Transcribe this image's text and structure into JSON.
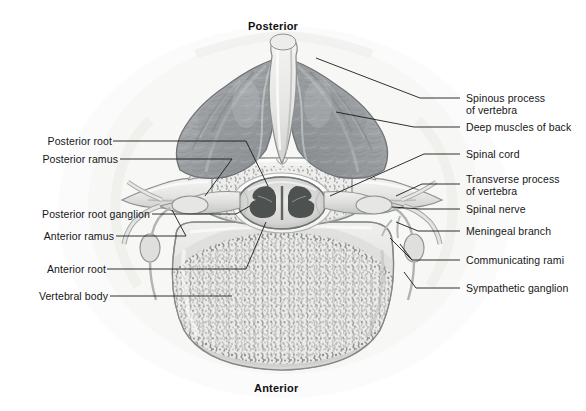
{
  "figure": {
    "title_top": "Posterior",
    "title_bottom": "Anterior",
    "background_color": "#ffffff",
    "line_color": "#1a1a1a",
    "text_color": "#161616"
  },
  "orientation_labels": [
    {
      "name": "posterior",
      "text": "Posterior",
      "x": 280,
      "y": 20
    },
    {
      "name": "anterior",
      "text": "Anterior",
      "x": 280,
      "y": 382
    }
  ],
  "left_labels": [
    {
      "id": "posterior-root",
      "text": "Posterior root",
      "x": 28,
      "y": 138
    },
    {
      "id": "posterior-ramus",
      "text": "Posterior ramus",
      "x": 28,
      "y": 156
    },
    {
      "id": "posterior-root-ganglion",
      "text": "Posterior root ganglion",
      "x": 28,
      "y": 211
    },
    {
      "id": "anterior-ramus",
      "text": "Anterior ramus",
      "x": 28,
      "y": 233
    },
    {
      "id": "anterior-root",
      "text": "Anterior root",
      "x": 28,
      "y": 266
    },
    {
      "id": "vertebral-body",
      "text": "Vertebral body",
      "x": 28,
      "y": 293
    }
  ],
  "right_labels": [
    {
      "id": "spinous-process",
      "line1": "Spinous process",
      "line2": "of vertebra",
      "x": 466,
      "y": 94
    },
    {
      "id": "deep-muscles-of-back",
      "line1": "Deep muscles of back",
      "line2": "",
      "x": 466,
      "y": 124
    },
    {
      "id": "spinal-cord",
      "line1": "Spinal cord",
      "line2": "",
      "x": 466,
      "y": 151
    },
    {
      "id": "transverse-process",
      "line1": "Transverse process",
      "line2": "of vertebra",
      "x": 466,
      "y": 175
    },
    {
      "id": "spinal-nerve",
      "line1": "Spinal nerve",
      "line2": "",
      "x": 466,
      "y": 206
    },
    {
      "id": "meningeal-branch",
      "line1": "Meningeal branch",
      "line2": "",
      "x": 466,
      "y": 228
    },
    {
      "id": "communicating-rami",
      "line1": "Communicating rami",
      "line2": "",
      "x": 466,
      "y": 257
    },
    {
      "id": "sympathetic-ganglion",
      "line1": "Sympathetic ganglion",
      "line2": "",
      "x": 466,
      "y": 285
    }
  ],
  "anatomy_parts": [
    {
      "id": "spinous-process-structure",
      "label": "Spinous process of vertebra"
    },
    {
      "id": "deep-back-muscle-left",
      "label": "Deep muscles of back (left)"
    },
    {
      "id": "deep-back-muscle-right",
      "label": "Deep muscles of back (right)"
    },
    {
      "id": "vertebral-arch",
      "label": "Vertebral arch / lamina"
    },
    {
      "id": "spinal-cord-structure",
      "label": "Spinal cord with grey matter"
    },
    {
      "id": "vertebral-body-structure",
      "label": "Vertebral body with cancellous bone"
    },
    {
      "id": "transverse-process-left",
      "label": "Transverse process (left)"
    },
    {
      "id": "transverse-process-right",
      "label": "Transverse process (right)"
    },
    {
      "id": "spinal-nerve-left",
      "label": "Spinal nerve (left)"
    },
    {
      "id": "spinal-nerve-right",
      "label": "Spinal nerve (right)"
    },
    {
      "id": "sympathetic-ganglion-left",
      "label": "Sympathetic ganglion (left)"
    },
    {
      "id": "sympathetic-ganglion-right",
      "label": "Sympathetic ganglion (right)"
    }
  ]
}
